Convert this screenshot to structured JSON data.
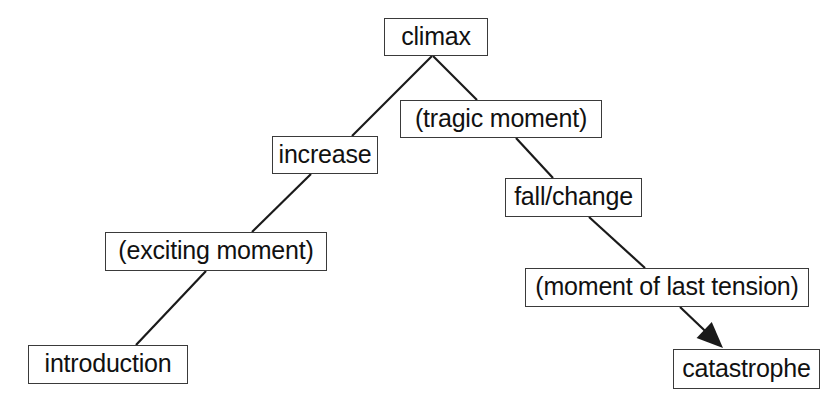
{
  "diagram": {
    "background_color": "#ffffff",
    "box_border_color": "#3a3a3a",
    "edge_color": "#1a1a1a",
    "text_color": "#111111",
    "nodes": [
      {
        "id": "climax",
        "label": "climax",
        "x": 384,
        "y": 18,
        "w": 104,
        "h": 38
      },
      {
        "id": "tragic",
        "label": "(tragic moment)",
        "x": 400,
        "y": 100,
        "w": 202,
        "h": 38
      },
      {
        "id": "increase",
        "label": "increase",
        "x": 272,
        "y": 136,
        "w": 106,
        "h": 38
      },
      {
        "id": "fall",
        "label": "fall/change",
        "x": 505,
        "y": 178,
        "w": 137,
        "h": 39
      },
      {
        "id": "exciting",
        "label": "(exciting moment)",
        "x": 105,
        "y": 232,
        "w": 222,
        "h": 39
      },
      {
        "id": "tension",
        "label": "(moment of last tension)",
        "x": 525,
        "y": 268,
        "w": 284,
        "h": 39
      },
      {
        "id": "introduction",
        "label": "introduction",
        "x": 28,
        "y": 345,
        "w": 160,
        "h": 39
      },
      {
        "id": "catastrophe",
        "label": "catastrophe",
        "x": 673,
        "y": 349,
        "w": 147,
        "h": 40
      }
    ],
    "edges": [
      {
        "id": "climax-increase",
        "from": "climax",
        "to": "increase",
        "x1": 432,
        "y1": 56,
        "x2": 352,
        "y2": 136,
        "arrow": false
      },
      {
        "id": "climax-tragic",
        "from": "climax",
        "to": "tragic",
        "x1": 433,
        "y1": 56,
        "x2": 477,
        "y2": 100,
        "arrow": false
      },
      {
        "id": "increase-exciting",
        "from": "increase",
        "to": "exciting",
        "x1": 311,
        "y1": 174,
        "x2": 252,
        "y2": 232,
        "arrow": false
      },
      {
        "id": "tragic-fall",
        "from": "tragic",
        "to": "fall",
        "x1": 516,
        "y1": 138,
        "x2": 553,
        "y2": 178,
        "arrow": false
      },
      {
        "id": "exciting-introduction",
        "from": "exciting",
        "to": "introduction",
        "x1": 206,
        "y1": 271,
        "x2": 136,
        "y2": 345,
        "arrow": false
      },
      {
        "id": "fall-tension",
        "from": "fall",
        "to": "tension",
        "x1": 589,
        "y1": 217,
        "x2": 645,
        "y2": 268,
        "arrow": false
      },
      {
        "id": "tension-catastrophe",
        "from": "tension",
        "to": "catastrophe",
        "x1": 680,
        "y1": 307,
        "x2": 723,
        "y2": 348,
        "arrow": true
      }
    ]
  }
}
